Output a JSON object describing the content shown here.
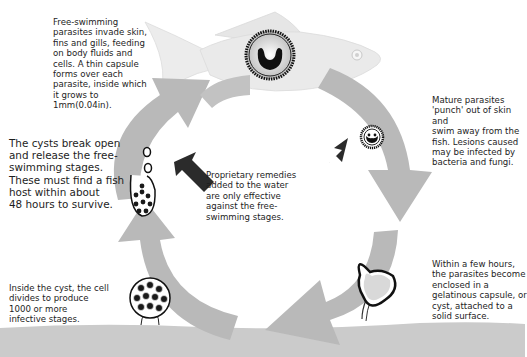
{
  "diagram": {
    "stages": [
      {
        "id": "top",
        "text": "Free-swimming\nparasites invade skin,\nfins and gills, feeding\non body fluids and\ncells. A thin capsule\nforms over each\nparasite, inside which\nit grows to\n1mm(0.04in)."
      },
      {
        "id": "right-top",
        "text": "Mature parasites\n'punch' out of skin and\nswim away from the\nfish. Lesions caused\nmay be infected by\nbacteria and fungi."
      },
      {
        "id": "right-bottom",
        "text": "Within a few hours,\nthe parasites become\nenclosed in a\ngelatinous capsule, or\ncyst, attached to a\nsolid surface."
      },
      {
        "id": "bottom-left",
        "text": "Inside the cyst, the cell\ndivides to produce\n1000 or more\ninfective stages."
      },
      {
        "id": "left",
        "text": "The cysts break open\nand release the free-\nswimming stages.\nThese must find a fish\nhost within about\n48 hours to survive."
      }
    ],
    "center_note": "Proprietary remedies\nadded to the water\nare only effective\nagainst the free-\nswimming stages.",
    "icons": [
      "fish-icon",
      "parasite-in-skin-icon",
      "mature-parasite-icon",
      "cyst-icon",
      "dividing-cyst-icon",
      "bursting-cyst-icon",
      "cycle-arrow-icon",
      "remedy-arrow-icon"
    ],
    "colors": {
      "cycle_arrow": "#b8b8b8",
      "fish_body": "#e9e9e9",
      "ground": "#c9c9c9",
      "dark_arrow": "#2b2b2b",
      "text": "#1d1d1d"
    }
  }
}
